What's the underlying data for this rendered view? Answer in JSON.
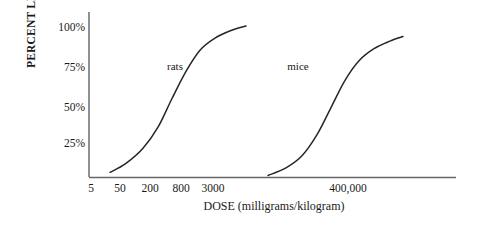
{
  "chart_data": {
    "type": "line",
    "title": "",
    "xlabel": "DOSE (milligrams/kilogram)",
    "ylabel": "PERCENT LETHALITY",
    "x_tick_labels": [
      "5",
      "50",
      "200",
      "800",
      "3000",
      "400,000"
    ],
    "y_tick_labels": [
      "100%",
      "75%",
      "50%",
      "25%"
    ],
    "y_tick_values": [
      100,
      75,
      50,
      25
    ],
    "ylim": [
      0,
      110
    ],
    "grid": false,
    "legend": "inline-curve-labels",
    "axis_style": "left-spine-and-bottom-spine",
    "series": [
      {
        "name": "rats",
        "label": "rats",
        "description": "sigmoid dose-response curve for rats, low dose range",
        "points": [
          {
            "x_px": 110,
            "percent": 3
          },
          {
            "x_px": 126,
            "percent": 9
          },
          {
            "x_px": 143,
            "percent": 19
          },
          {
            "x_px": 158,
            "percent": 33
          },
          {
            "x_px": 172,
            "percent": 52
          },
          {
            "x_px": 186,
            "percent": 70
          },
          {
            "x_px": 200,
            "percent": 84
          },
          {
            "x_px": 215,
            "percent": 92
          },
          {
            "x_px": 231,
            "percent": 97
          },
          {
            "x_px": 246,
            "percent": 100
          }
        ]
      },
      {
        "name": "mice",
        "label": "mice",
        "description": "sigmoid dose-response curve for mice, high dose range",
        "points": [
          {
            "x_px": 268,
            "percent": 1
          },
          {
            "x_px": 286,
            "percent": 6
          },
          {
            "x_px": 302,
            "percent": 14
          },
          {
            "x_px": 317,
            "percent": 28
          },
          {
            "x_px": 331,
            "percent": 46
          },
          {
            "x_px": 345,
            "percent": 64
          },
          {
            "x_px": 359,
            "percent": 77
          },
          {
            "x_px": 374,
            "percent": 85
          },
          {
            "x_px": 390,
            "percent": 90
          },
          {
            "x_px": 403,
            "percent": 93
          }
        ]
      }
    ],
    "annotations": [
      {
        "text": "rats",
        "x_px": 175,
        "y_px": 66
      },
      {
        "text": "mice",
        "x_px": 298,
        "y_px": 66
      }
    ]
  },
  "colors": {
    "background": "#ffffff",
    "ink": "#1a1a1a",
    "axis": "#555555",
    "curve": "#262626"
  }
}
